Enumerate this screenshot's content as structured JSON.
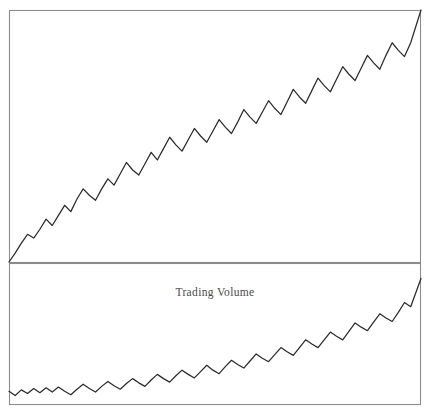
{
  "figure": {
    "background_color": "#ffffff",
    "frame_color": "#8c8c8c",
    "line_color": "#2b2b2b",
    "width": 429,
    "height": 415
  },
  "chart_data": [
    {
      "type": "line",
      "panel": "top",
      "title": "",
      "xlabel": "",
      "ylabel": "",
      "grid": false,
      "legend": null,
      "axis_ticks": {
        "x": [],
        "y": []
      },
      "xlim": [
        0,
        100
      ],
      "ylim": [
        0,
        100
      ],
      "plot_box_px": {
        "x": 9,
        "y": 10,
        "width": 412,
        "height": 252
      },
      "description": "Strongly rising trend with regular saw-tooth oscillations; starts at the bottom-left corner and ends at the top-right corner.",
      "series": [
        {
          "name": "Price",
          "x": [
            0,
            1.5,
            3,
            4.5,
            6,
            7.5,
            9,
            10.5,
            12,
            13.5,
            15,
            16.5,
            18,
            19.5,
            21,
            22.5,
            24,
            25.5,
            27,
            28.5,
            30,
            31.5,
            33,
            34.5,
            36,
            37.5,
            39,
            40.5,
            42,
            43.5,
            45,
            46.5,
            48,
            49.5,
            51,
            52.5,
            54,
            55.5,
            57,
            58.5,
            60,
            61.5,
            63,
            64.5,
            66,
            67.5,
            69,
            70.5,
            72,
            73.5,
            75,
            76.5,
            78,
            79.5,
            81,
            82.5,
            84,
            85.5,
            87,
            88.5,
            90,
            91.5,
            93,
            94.5,
            96,
            97.5,
            100
          ],
          "y": [
            0,
            3.5,
            7.5,
            11,
            9.5,
            13,
            17,
            14.5,
            18.5,
            22.5,
            20,
            25,
            29,
            26.5,
            24.5,
            29,
            33,
            30.5,
            35,
            39.5,
            36.5,
            34.5,
            39,
            43.5,
            40.5,
            45,
            49.5,
            46.5,
            44,
            48.5,
            53,
            50,
            47.5,
            52,
            56.5,
            53.5,
            51,
            55.5,
            60.5,
            57.5,
            55,
            59.5,
            64,
            61,
            58.5,
            63.5,
            68.5,
            65.5,
            63,
            68,
            73,
            70,
            67.5,
            72.5,
            77.5,
            74.5,
            72,
            77,
            82,
            79,
            76.5,
            82,
            87,
            84,
            81.5,
            87,
            100
          ]
        }
      ]
    },
    {
      "type": "line",
      "panel": "bottom",
      "title": "Trading Volume",
      "xlabel": "",
      "ylabel": "",
      "grid": false,
      "legend": null,
      "axis_ticks": {
        "x": [],
        "y": []
      },
      "xlim": [
        0,
        100
      ],
      "ylim": [
        0,
        100
      ],
      "plot_box_px": {
        "x": 9,
        "y": 263,
        "width": 412,
        "height": 141
      },
      "description": "Flat, gently oscillating start that accelerates upward; ends near the top-right of the panel.",
      "series": [
        {
          "name": "Trading Volume",
          "x": [
            0,
            1.5,
            3,
            4.5,
            6,
            7.5,
            9,
            10.5,
            12,
            13.5,
            15,
            16.5,
            18,
            19.5,
            21,
            22.5,
            24,
            25.5,
            27,
            28.5,
            30,
            31.5,
            33,
            34.5,
            36,
            37.5,
            39,
            40.5,
            42,
            43.5,
            45,
            46.5,
            48,
            49.5,
            51,
            52.5,
            54,
            55.5,
            57,
            58.5,
            60,
            61.5,
            63,
            64.5,
            66,
            67.5,
            69,
            70.5,
            72,
            73.5,
            75,
            76.5,
            78,
            79.5,
            81,
            82.5,
            84,
            85.5,
            87,
            88.5,
            90,
            91.5,
            93,
            94.5,
            96,
            97.5,
            100
          ],
          "y": [
            9,
            6,
            10,
            7.5,
            11,
            8,
            11.5,
            8.5,
            12,
            9,
            6.5,
            10.5,
            14,
            11,
            8.5,
            12.5,
            16,
            13,
            10.5,
            14.5,
            18,
            15,
            12.5,
            17,
            21,
            18,
            15.5,
            20,
            24,
            21,
            18.5,
            23,
            27.5,
            24,
            21.5,
            26.5,
            31,
            28,
            25.5,
            30.5,
            35.5,
            32.5,
            30,
            35,
            40,
            37,
            34.5,
            40,
            45.5,
            42.5,
            40,
            45.5,
            51,
            48,
            45.5,
            51.5,
            57.5,
            54.5,
            52,
            58,
            64,
            61,
            58.5,
            65,
            72,
            69,
            89
          ]
        }
      ]
    }
  ],
  "labels": {
    "bottom_panel_title": "Trading Volume"
  }
}
